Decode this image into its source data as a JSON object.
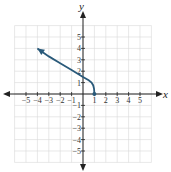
{
  "chart_data": {
    "type": "line",
    "title": "",
    "xlabel": "x",
    "ylabel": "y",
    "xlim": [
      -6,
      6
    ],
    "ylim": [
      -6,
      6
    ],
    "grid": true,
    "x_ticks": [
      -5,
      -4,
      -3,
      -2,
      -1,
      1,
      2,
      3,
      4,
      5
    ],
    "y_ticks": [
      -5,
      -4,
      -3,
      -2,
      -1,
      1,
      2,
      3,
      4,
      5
    ],
    "series": [
      {
        "name": "curve",
        "color": "#2a5a7a",
        "start_point": [
          1,
          0
        ],
        "end_arrow": [
          -4,
          4
        ],
        "points": [
          [
            1,
            0
          ],
          [
            0.97,
            0.45
          ],
          [
            0.9,
            0.75
          ],
          [
            0.75,
            1.0
          ],
          [
            0.5,
            1.2
          ],
          [
            0,
            1.5
          ],
          [
            -1,
            2.1
          ],
          [
            -2,
            2.7
          ],
          [
            -3,
            3.3
          ],
          [
            -4,
            4
          ]
        ]
      }
    ]
  },
  "labels": {
    "x_axis": "x",
    "y_axis": "y"
  },
  "colors": {
    "curve": "#2a5a7a",
    "grid": "#d8d8d8",
    "axis": "#222222"
  }
}
